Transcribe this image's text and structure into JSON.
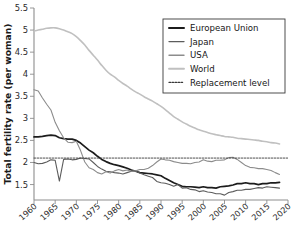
{
  "chart_data": {
    "type": "line",
    "title": "",
    "xlabel": "",
    "ylabel": "Total fertility rate (per woman)",
    "xlim": [
      1960,
      2020
    ],
    "ylim": [
      1.15,
      5.5
    ],
    "grid": false,
    "legend_position": "top-right",
    "yticks": [
      "1.5",
      "2",
      "2.5",
      "3",
      "3.5",
      "4",
      "4.5",
      "5",
      "5.5"
    ],
    "ytick_values": [
      1.5,
      2.0,
      2.5,
      3.0,
      3.5,
      4.0,
      4.5,
      5.0,
      5.5
    ],
    "xticks": [
      "1960",
      "1965",
      "1970",
      "1975",
      "1980",
      "1985",
      "1990",
      "1995",
      "2000",
      "2005",
      "2010",
      "2015",
      "2020"
    ],
    "xtick_values": [
      1960,
      1965,
      1970,
      1975,
      1980,
      1985,
      1990,
      1995,
      2000,
      2005,
      2010,
      2015,
      2020
    ],
    "x": [
      1960,
      1961,
      1962,
      1963,
      1964,
      1965,
      1966,
      1967,
      1968,
      1969,
      1970,
      1971,
      1972,
      1973,
      1974,
      1975,
      1976,
      1977,
      1978,
      1979,
      1980,
      1981,
      1982,
      1983,
      1984,
      1985,
      1986,
      1987,
      1988,
      1989,
      1990,
      1991,
      1992,
      1993,
      1994,
      1995,
      1996,
      1997,
      1998,
      1999,
      2000,
      2001,
      2002,
      2003,
      2004,
      2005,
      2006,
      2007,
      2008,
      2009,
      2010,
      2011,
      2012,
      2013,
      2014,
      2015,
      2016,
      2017,
      2018
    ],
    "series": [
      {
        "name": "European Union",
        "color": "#1c1c1c",
        "width": 1.7,
        "dash": "none",
        "values": [
          2.58,
          2.58,
          2.59,
          2.61,
          2.62,
          2.61,
          2.56,
          2.54,
          2.53,
          2.53,
          2.5,
          2.44,
          2.36,
          2.28,
          2.22,
          2.14,
          2.07,
          2.02,
          1.98,
          1.95,
          1.93,
          1.9,
          1.87,
          1.83,
          1.8,
          1.77,
          1.76,
          1.75,
          1.74,
          1.72,
          1.7,
          1.64,
          1.59,
          1.54,
          1.5,
          1.46,
          1.45,
          1.45,
          1.44,
          1.43,
          1.45,
          1.43,
          1.43,
          1.42,
          1.45,
          1.46,
          1.47,
          1.49,
          1.52,
          1.52,
          1.54,
          1.52,
          1.52,
          1.5,
          1.52,
          1.52,
          1.54,
          1.54,
          1.55
        ]
      },
      {
        "name": "Japan",
        "color": "#5c5c5c",
        "width": 1.1,
        "dash": "none",
        "values": [
          2.0,
          1.97,
          1.98,
          2.01,
          2.06,
          2.05,
          1.58,
          2.07,
          2.08,
          2.06,
          2.07,
          2.1,
          2.09,
          2.08,
          2.0,
          1.91,
          1.85,
          1.8,
          1.79,
          1.77,
          1.76,
          1.74,
          1.77,
          1.8,
          1.81,
          1.76,
          1.72,
          1.69,
          1.66,
          1.57,
          1.54,
          1.53,
          1.5,
          1.46,
          1.5,
          1.42,
          1.43,
          1.39,
          1.38,
          1.34,
          1.36,
          1.33,
          1.32,
          1.29,
          1.29,
          1.26,
          1.32,
          1.34,
          1.37,
          1.37,
          1.39,
          1.39,
          1.41,
          1.43,
          1.42,
          1.45,
          1.44,
          1.43,
          1.42
        ]
      },
      {
        "name": "USA",
        "color": "#8c8c8c",
        "width": 1.1,
        "dash": "none",
        "values": [
          3.65,
          3.62,
          3.46,
          3.32,
          3.19,
          2.91,
          2.72,
          2.56,
          2.46,
          2.45,
          2.48,
          2.27,
          2.01,
          1.88,
          1.84,
          1.77,
          1.74,
          1.79,
          1.76,
          1.81,
          1.84,
          1.81,
          1.83,
          1.8,
          1.81,
          1.84,
          1.84,
          1.87,
          1.93,
          2.01,
          2.08,
          2.06,
          2.05,
          2.02,
          2.0,
          1.98,
          1.98,
          1.97,
          2.0,
          2.01,
          2.06,
          2.03,
          2.02,
          2.05,
          2.05,
          2.06,
          2.11,
          2.12,
          2.07,
          2.0,
          1.93,
          1.89,
          1.88,
          1.86,
          1.86,
          1.84,
          1.82,
          1.77,
          1.73
        ]
      },
      {
        "name": "World",
        "color": "#c0c0c0",
        "width": 1.6,
        "dash": "none",
        "values": [
          4.98,
          5.0,
          5.02,
          5.04,
          5.05,
          5.05,
          5.03,
          5.0,
          4.96,
          4.92,
          4.85,
          4.76,
          4.66,
          4.54,
          4.43,
          4.32,
          4.2,
          4.09,
          4.0,
          3.94,
          3.86,
          3.79,
          3.73,
          3.66,
          3.6,
          3.55,
          3.49,
          3.44,
          3.39,
          3.33,
          3.27,
          3.2,
          3.12,
          3.04,
          2.98,
          2.92,
          2.87,
          2.82,
          2.78,
          2.74,
          2.71,
          2.68,
          2.65,
          2.63,
          2.61,
          2.59,
          2.58,
          2.57,
          2.55,
          2.54,
          2.53,
          2.52,
          2.51,
          2.5,
          2.48,
          2.47,
          2.45,
          2.44,
          2.42
        ]
      },
      {
        "name": "Replacement level",
        "color": "#3a3a3a",
        "width": 0.9,
        "dash": "1.6,1.4",
        "constant": 2.1
      }
    ]
  },
  "legend": {
    "entries": [
      {
        "label": "European Union"
      },
      {
        "label": "Japan"
      },
      {
        "label": "USA"
      },
      {
        "label": "World"
      },
      {
        "label": "Replacement level"
      }
    ]
  }
}
